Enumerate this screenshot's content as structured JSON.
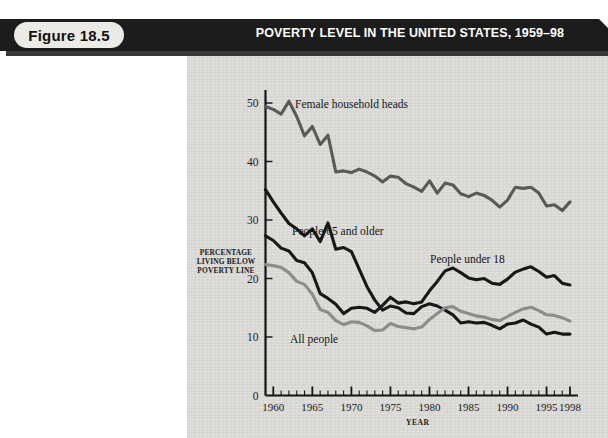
{
  "figure": {
    "badge": "Figure 18.5",
    "title": "POVERTY LEVEL IN THE UNITED STATES, 1959–98"
  },
  "chart_data": {
    "type": "line",
    "title": "POVERTY LEVEL IN THE UNITED STATES, 1959–98",
    "xlabel": "YEAR",
    "ylabel": "PERCENTAGE LIVING BELOW POVERTY LINE",
    "ylabel_lines": [
      "PERCENTAGE",
      "LIVING BELOW",
      "POVERTY LINE"
    ],
    "xlim": [
      1959,
      1998
    ],
    "ylim": [
      0,
      52
    ],
    "yticks": [
      0,
      10,
      20,
      30,
      40,
      50
    ],
    "ytick_labels": [
      "0",
      "10",
      "20",
      "30",
      "40",
      "50"
    ],
    "xticks_major": [
      1960,
      1965,
      1970,
      1975,
      1980,
      1985,
      1990,
      1995,
      1998
    ],
    "xtick_labels": [
      "1960",
      "1965",
      "1970",
      "1975",
      "1980",
      "1985",
      "1990",
      "1995",
      "1998"
    ],
    "xtick_minor_step": 1,
    "grid": false,
    "legend": "inline-annotations",
    "x": [
      1959,
      1960,
      1961,
      1962,
      1963,
      1964,
      1965,
      1966,
      1967,
      1968,
      1969,
      1970,
      1971,
      1972,
      1973,
      1974,
      1975,
      1976,
      1977,
      1978,
      1979,
      1980,
      1981,
      1982,
      1983,
      1984,
      1985,
      1986,
      1987,
      1988,
      1989,
      1990,
      1991,
      1992,
      1993,
      1994,
      1995,
      1996,
      1997,
      1998
    ],
    "series": [
      {
        "name": "Female household heads",
        "color": "#595959",
        "values": [
          49.4,
          48.9,
          48.1,
          50.3,
          47.7,
          44.4,
          46.0,
          42.9,
          44.5,
          38.2,
          38.4,
          38.1,
          38.7,
          38.2,
          37.5,
          36.5,
          37.5,
          37.3,
          36.2,
          35.6,
          34.9,
          36.7,
          34.6,
          36.3,
          36.0,
          34.5,
          34.0,
          34.6,
          34.2,
          33.4,
          32.2,
          33.4,
          35.6,
          35.4,
          35.6,
          34.6,
          32.4,
          32.6,
          31.6,
          33.1
        ]
      },
      {
        "name": "People 65 and older",
        "color": "#171717",
        "values": [
          35.2,
          33.1,
          31.2,
          29.4,
          28.5,
          27.3,
          28.5,
          26.3,
          29.5,
          25.0,
          25.3,
          24.6,
          21.6,
          18.6,
          16.3,
          14.6,
          15.3,
          15.0,
          14.1,
          14.0,
          15.2,
          15.7,
          15.3,
          14.6,
          13.8,
          12.4,
          12.6,
          12.4,
          12.5,
          12.0,
          11.4,
          12.2,
          12.4,
          12.9,
          12.2,
          11.7,
          10.5,
          10.8,
          10.5,
          10.5
        ]
      },
      {
        "name": "People under 18",
        "color": "#171717",
        "values": [
          27.3,
          26.5,
          25.2,
          24.7,
          23.1,
          22.7,
          21.0,
          17.4,
          16.6,
          15.6,
          14.0,
          14.9,
          15.1,
          14.9,
          14.2,
          15.4,
          16.8,
          15.8,
          16.0,
          15.7,
          16.0,
          17.9,
          19.5,
          21.3,
          21.8,
          21.0,
          20.1,
          19.8,
          20.0,
          19.2,
          19.0,
          19.9,
          21.1,
          21.6,
          22.0,
          21.2,
          20.2,
          20.5,
          19.2,
          18.9
        ]
      },
      {
        "name": "All people",
        "color": "#8c8c8c",
        "values": [
          22.4,
          22.2,
          21.9,
          21.0,
          19.5,
          19.0,
          17.3,
          14.7,
          14.2,
          12.8,
          12.1,
          12.6,
          12.5,
          11.9,
          11.1,
          11.2,
          12.3,
          11.8,
          11.6,
          11.4,
          11.7,
          13.0,
          14.0,
          15.0,
          15.2,
          14.4,
          14.0,
          13.6,
          13.4,
          13.0,
          12.8,
          13.5,
          14.2,
          14.8,
          15.1,
          14.5,
          13.8,
          13.7,
          13.3,
          12.7
        ]
      }
    ],
    "annotations": [
      {
        "text": "Female household heads",
        "series": "Female household heads"
      },
      {
        "text": "People 65 and older",
        "series": "People 65 and older"
      },
      {
        "text": "People under 18",
        "series": "People under 18"
      },
      {
        "text": "All people",
        "series": "All people"
      }
    ]
  }
}
